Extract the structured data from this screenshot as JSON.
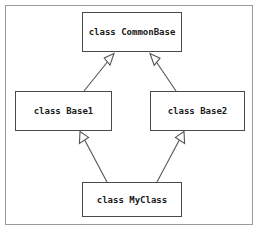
{
  "diagram": {
    "kind": "inheritance-diagram",
    "background_color": "#ffffff",
    "frame_color": "#9a9a9a",
    "node_border_color": "#4a4a4a",
    "edge_color": "#555555",
    "text_color": "#1a1a1a",
    "nodes": [
      {
        "id": "commonbase",
        "label": "class CommonBase"
      },
      {
        "id": "base1",
        "label": "class Base1"
      },
      {
        "id": "base2",
        "label": "class Base2"
      },
      {
        "id": "myclass",
        "label": "class MyClass"
      }
    ],
    "edges": [
      {
        "id": "base1-to-commonbase",
        "from": "base1",
        "to": "commonbase",
        "type": "generalization",
        "arrowhead": "hollow-triangle"
      },
      {
        "id": "base2-to-commonbase",
        "from": "base2",
        "to": "commonbase",
        "type": "generalization",
        "arrowhead": "hollow-triangle"
      },
      {
        "id": "myclass-to-base1",
        "from": "myclass",
        "to": "base1",
        "type": "generalization",
        "arrowhead": "hollow-triangle"
      },
      {
        "id": "myclass-to-base2",
        "from": "myclass",
        "to": "base2",
        "type": "generalization",
        "arrowhead": "hollow-triangle"
      }
    ]
  }
}
